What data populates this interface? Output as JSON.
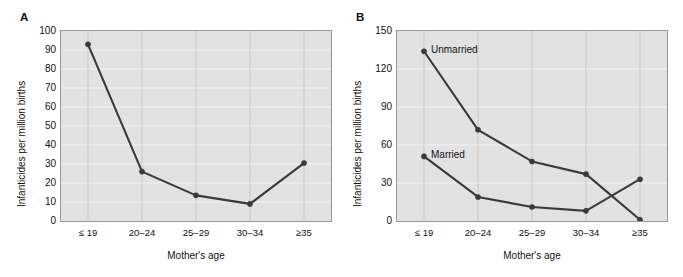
{
  "figure": {
    "panels": [
      {
        "letter": "A",
        "ylabel": "Infanticides per million births",
        "xlabel": "Mother's age"
      },
      {
        "letter": "B",
        "ylabel": "Infanticides per million births",
        "xlabel": "Mother's age"
      }
    ],
    "colors": {
      "plot_background": "#e2e2e2",
      "gridline": "#f2f2f2",
      "gridline_vertical": "#c9c9c9",
      "series": "#3a3a3a",
      "axis_border": "#9a9a9a",
      "text": "#111111"
    }
  },
  "chart_data": [
    {
      "type": "line",
      "panel": "A",
      "title": "",
      "xlabel": "Mother's age",
      "ylabel": "Infanticides per million births",
      "categories": [
        "≤ 19",
        "20–24",
        "25–29",
        "30–34",
        "≥35"
      ],
      "values": [
        93,
        26,
        13.5,
        9,
        30.5
      ],
      "ylim": [
        0,
        100
      ],
      "yticks": [
        0,
        10,
        20,
        30,
        40,
        50,
        60,
        70,
        80,
        90,
        100
      ],
      "grid": true,
      "legend": "none",
      "markers": true
    },
    {
      "type": "line",
      "panel": "B",
      "title": "",
      "xlabel": "Mother's age",
      "ylabel": "Infanticides per million births",
      "categories": [
        "≤ 19",
        "20–24",
        "25–29",
        "30–34",
        "≥35"
      ],
      "series": [
        {
          "name": "Unmarried",
          "values": [
            134,
            72,
            47,
            37,
            1
          ]
        },
        {
          "name": "Married",
          "values": [
            51,
            19,
            11,
            8,
            33
          ]
        }
      ],
      "ylim": [
        0,
        150
      ],
      "yticks": [
        0,
        30,
        60,
        90,
        120,
        150
      ],
      "grid": true,
      "legend": "inline-annotations",
      "annotations": [
        {
          "text": "Unmarried",
          "anchor_category": "≤ 19",
          "anchor_value": 134
        },
        {
          "text": "Married",
          "anchor_category": "≤ 19",
          "anchor_value": 51
        }
      ],
      "markers": true
    }
  ]
}
